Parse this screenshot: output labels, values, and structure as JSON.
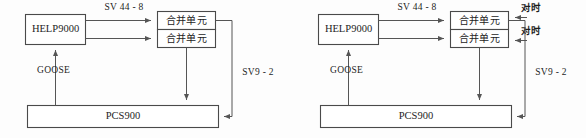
{
  "figure": {
    "background_color": "#fdfdfd",
    "line_color": "#6f6f6f",
    "box_stroke_color": "#4a4a4a",
    "text_color": "#1d1d1d"
  },
  "panels": [
    {
      "id": "left-panel",
      "name": "left-diagram",
      "nodes": {
        "controller": "HELP9000",
        "merging_unit_top": "合并单元",
        "merging_unit_bottom": "合并单元",
        "protection_device": "PCS900"
      },
      "edge_labels": {
        "sv_bus": "SV 44 - 8",
        "goose": "GOOSE",
        "sv9_2": "SV9 - 2"
      },
      "time_sync_labels": []
    },
    {
      "id": "right-panel",
      "name": "right-diagram",
      "nodes": {
        "controller": "HELP9000",
        "merging_unit_top": "合并单元",
        "merging_unit_bottom": "合并单元",
        "protection_device": "PCS900"
      },
      "edge_labels": {
        "sv_bus": "SV 44 - 8",
        "goose": "GOOSE",
        "sv9_2": "SV9 - 2"
      },
      "time_sync_labels": [
        "对时",
        "对时"
      ]
    }
  ]
}
